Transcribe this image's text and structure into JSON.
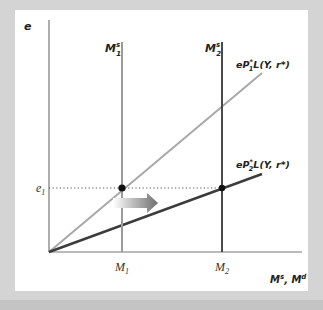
{
  "diagram": {
    "y_axis_label": "e",
    "x_axis_label": "M^s, M^d",
    "x_axis_label_main": "M",
    "x_axis_label_sup1": "s",
    "x_axis_label_sep": ", M",
    "x_axis_label_sup2": "d",
    "supply_curves": [
      {
        "name": "M1s",
        "label_main": "M",
        "label_sup": "s",
        "label_sub": "1",
        "tick_label": "M1",
        "tick_main": "M",
        "tick_sub": "1",
        "color": "#9a9a9a"
      },
      {
        "name": "M2s",
        "label_main": "M",
        "label_sup": "s",
        "label_sub": "2",
        "tick_label": "M2",
        "tick_main": "M",
        "tick_sub": "2",
        "color": "#4a4a4a"
      }
    ],
    "demand_curves": [
      {
        "name": "eP1*L(Y, r*)",
        "label_pre": "eP",
        "label_sub": "1",
        "label_sup": "*",
        "label_post": "L(Y, r*)",
        "color": "#a8a8a8"
      },
      {
        "name": "eP2*L(Y, r*)",
        "label_pre": "eP",
        "label_sub": "2",
        "label_sup": "*",
        "label_post": "L(Y, r*)",
        "color": "#3c3c3c"
      }
    ],
    "equilibrium": {
      "label_main": "e",
      "label_sub": "1",
      "points": [
        "e1 at M1",
        "e1 at M2"
      ]
    },
    "shift_arrow": {
      "direction": "right",
      "meaning": "money supply increase M1 to M2"
    },
    "colors": {
      "background": "#d4d4d4",
      "panel": "#ffffff",
      "axis": "#555555",
      "point": "#111111"
    }
  }
}
